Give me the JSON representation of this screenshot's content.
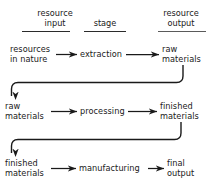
{
  "diagram": {
    "title_columns": [
      {
        "id": "resource-input",
        "label": "resource\ninput"
      },
      {
        "id": "stage",
        "label": "stage"
      },
      {
        "id": "resource-output",
        "label": "resource\noutput"
      }
    ],
    "rows": [
      {
        "id": "row-extraction",
        "input": "resources\nin nature",
        "stage": "extraction",
        "output": "raw\nmaterials"
      },
      {
        "id": "row-processing",
        "input": "raw\nmaterials",
        "stage": "processing",
        "output": "finished\nmaterials"
      },
      {
        "id": "row-manufacturing",
        "input": "finished\nmaterials",
        "stage": "manufacturing",
        "output": "final\noutput"
      }
    ],
    "connectors": [
      {
        "id": "connector-raw-materials",
        "from": "raw materials",
        "to": "raw materials"
      },
      {
        "id": "connector-finished-materials",
        "from": "finished materials",
        "to": "finished materials"
      }
    ],
    "colors": {
      "ink": "#1a1a1a",
      "rule": "#2b2b2b",
      "background": "#ffffff"
    }
  }
}
